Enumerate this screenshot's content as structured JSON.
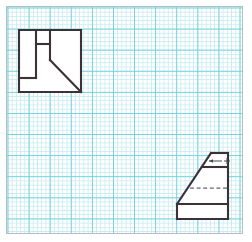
{
  "canvas": {
    "width": 252,
    "height": 242,
    "background": "#ffffff"
  },
  "sheet": {
    "label": "graph-paper-sheet",
    "x": 6,
    "y": 6,
    "width": 237,
    "height": 228,
    "paper_color": "#ffffff",
    "border_color": "#b9bdc0",
    "grid": {
      "minor_spacing_px": 4.22,
      "minor_color": "#bfe9ef",
      "major_spacing_px": 21.1,
      "major_color": "#6fd0dd",
      "cells_per_major": 5,
      "visible": true
    }
  },
  "style": {
    "visible_line_color": "#3b3238",
    "visible_line_width": 2.1,
    "hidden_line_color": "#6b6470",
    "hidden_line_width": 1.25,
    "hidden_dash_pattern": "4 2.6",
    "leader_color": "#4a4450"
  },
  "views": [
    {
      "id": "top-view",
      "name": "Top view (plan) — notched square block",
      "position": "upper-left",
      "bounds": {
        "x": 19,
        "y": 30,
        "width": 62,
        "height": 62
      },
      "outline_points": "19,30 81,30 81,92 19,92",
      "visible_edges": [
        {
          "name": "outer-square-top",
          "d": "M 19 30 L 81 30"
        },
        {
          "name": "outer-square-right",
          "d": "M 81 30 L 81 92"
        },
        {
          "name": "outer-square-bottom",
          "d": "M 81 92 L 19 92"
        },
        {
          "name": "outer-square-left",
          "d": "M 19 92 L 19 30"
        },
        {
          "name": "inner-vertical-left",
          "d": "M 36 30 L 36 78"
        },
        {
          "name": "inner-horizontal-lower",
          "d": "M 19 78 L 36 78"
        },
        {
          "name": "inner-vertical-right",
          "d": "M 50 30 L 50 60"
        },
        {
          "name": "inner-horizontal-upper",
          "d": "M 36 44 L 50 44"
        },
        {
          "name": "chamfer-diagonal",
          "d": "M 50 60 L 81 92"
        }
      ]
    },
    {
      "id": "side-view",
      "name": "Side view — wedge block with step",
      "position": "lower-right",
      "bounds": {
        "x": 177,
        "y": 153,
        "width": 51,
        "height": 66
      },
      "outline_points": "211,153 228,153 228,219 177,219 177,204",
      "visible_edges": [
        {
          "name": "apex-top-edge",
          "d": "M 211 153 L 228 153"
        },
        {
          "name": "right-edge",
          "d": "M 228 153 L 228 219"
        },
        {
          "name": "base-bottom-edge",
          "d": "M 228 219 L 177 219"
        },
        {
          "name": "base-left-edge",
          "d": "M 177 219 L 177 204"
        },
        {
          "name": "slope-diagonal",
          "d": "M 177 204 L 211 153"
        },
        {
          "name": "step-horizontal",
          "d": "M 202 167 L 228 167"
        },
        {
          "name": "base-top-horizontal",
          "d": "M 177 204 L 228 204"
        }
      ],
      "hidden_edges": [
        {
          "name": "hidden-horizontal",
          "d": "M 190 188 L 228 188"
        }
      ],
      "annotations": [
        {
          "name": "surface-leader",
          "type": "leader-with-cross-mark",
          "leader_d": "M 209 161 L 222 161",
          "arrow_d": "M 209 161 L 213 159.3 L 213 162.7 Z",
          "mark_h_d": "M 224 161 L 230 161",
          "mark_v_d": "M 227 158 L 227 164",
          "text": ""
        }
      ]
    }
  ]
}
